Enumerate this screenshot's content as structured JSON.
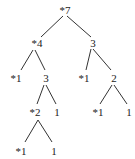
{
  "diagram": {
    "type": "tree",
    "line_color": "#333333",
    "text_color": "#222222",
    "nodes": [
      {
        "id": "n0",
        "label": "*7",
        "x": 65,
        "y": 10
      },
      {
        "id": "n1",
        "label": "*4",
        "x": 37,
        "y": 43
      },
      {
        "id": "n2",
        "label": "3",
        "x": 93,
        "y": 43
      },
      {
        "id": "n3",
        "label": "*1",
        "x": 16,
        "y": 78
      },
      {
        "id": "n4",
        "label": "3",
        "x": 46,
        "y": 78
      },
      {
        "id": "n5",
        "label": "*1",
        "x": 84,
        "y": 78
      },
      {
        "id": "n6",
        "label": "2",
        "x": 114,
        "y": 78
      },
      {
        "id": "n7",
        "label": "*2",
        "x": 35,
        "y": 112
      },
      {
        "id": "n8",
        "label": "1",
        "x": 57,
        "y": 112
      },
      {
        "id": "n9",
        "label": "*1",
        "x": 98,
        "y": 112
      },
      {
        "id": "n10",
        "label": "1",
        "x": 129,
        "y": 112
      },
      {
        "id": "n11",
        "label": "*1",
        "x": 21,
        "y": 151
      },
      {
        "id": "n12",
        "label": "1",
        "x": 54,
        "y": 151
      }
    ],
    "edges": [
      {
        "from": [
          63,
          16
        ],
        "to": [
          41,
          37
        ]
      },
      {
        "from": [
          67,
          16
        ],
        "to": [
          91,
          37
        ]
      },
      {
        "from": [
          33,
          50
        ],
        "to": [
          21,
          70
        ]
      },
      {
        "from": [
          35,
          50
        ],
        "to": [
          45,
          70
        ]
      },
      {
        "from": [
          91,
          49
        ],
        "to": [
          86,
          70
        ]
      },
      {
        "from": [
          93,
          49
        ],
        "to": [
          111,
          70
        ]
      },
      {
        "from": [
          44,
          85
        ],
        "to": [
          37,
          104
        ]
      },
      {
        "from": [
          46,
          85
        ],
        "to": [
          56,
          104
        ]
      },
      {
        "from": [
          112,
          85
        ],
        "to": [
          100,
          104
        ]
      },
      {
        "from": [
          114,
          85
        ],
        "to": [
          127,
          104
        ]
      },
      {
        "from": [
          38,
          120
        ],
        "to": [
          25,
          142
        ]
      },
      {
        "from": [
          38,
          120
        ],
        "to": [
          52,
          142
        ]
      }
    ]
  }
}
